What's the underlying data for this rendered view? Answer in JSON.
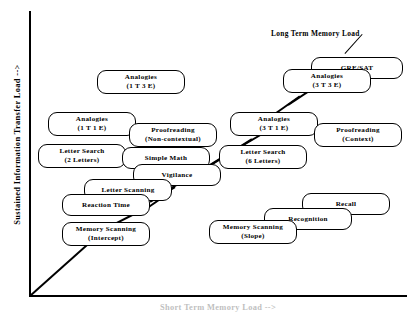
{
  "figure": {
    "y_axis_label": "Sustained Information Transfer Load -->",
    "x_axis_label": "Short Term Memory Load -->",
    "annotation": "Long Term Memory Load"
  },
  "chart_data": {
    "type": "scatter",
    "title": "",
    "xlabel": "Short Term Memory Load -->",
    "ylabel": "Sustained Information Transfer Load -->",
    "grid": false,
    "legend": null,
    "annotations": [
      "Long Term Memory Load"
    ],
    "nodes": [
      {
        "id": "analogies-1t3e",
        "line1": "Analogies",
        "line2": "(1 T   3 E)",
        "x": 97,
        "y": 70,
        "w": 88,
        "h": 24
      },
      {
        "id": "gre-sat",
        "line1": "GRE/SAT",
        "line2": "",
        "x": 311,
        "y": 57,
        "w": 92,
        "h": 22
      },
      {
        "id": "analogies-3t3e",
        "line1": "Analogies",
        "line2": "(3 T   3 E)",
        "x": 283,
        "y": 69,
        "w": 88,
        "h": 24
      },
      {
        "id": "analogies-1t1e",
        "line1": "Analogies",
        "line2": "(1 T   1 E)",
        "x": 48,
        "y": 112,
        "w": 88,
        "h": 24
      },
      {
        "id": "proofreading-noncontextual",
        "line1": "Proofreading",
        "line2": "(Non-contextual)",
        "x": 129,
        "y": 123,
        "w": 88,
        "h": 24
      },
      {
        "id": "analogies-3t1e",
        "line1": "Analogies",
        "line2": "(3 T   1 E)",
        "x": 230,
        "y": 112,
        "w": 88,
        "h": 24
      },
      {
        "id": "proofreading-context",
        "line1": "Proofreading",
        "line2": "(Context)",
        "x": 314,
        "y": 123,
        "w": 88,
        "h": 24
      },
      {
        "id": "letter-search-2",
        "line1": "Letter Search",
        "line2": "(2 Letters)",
        "x": 38,
        "y": 144,
        "w": 88,
        "h": 24
      },
      {
        "id": "simple-math",
        "line1": "Simple Math",
        "line2": "",
        "x": 122,
        "y": 147,
        "w": 88,
        "h": 22
      },
      {
        "id": "letter-search-6",
        "line1": "Letter Search",
        "line2": "(6 Letters)",
        "x": 219,
        "y": 145,
        "w": 88,
        "h": 24
      },
      {
        "id": "vigilance",
        "line1": "Vigilance",
        "line2": "",
        "x": 133,
        "y": 164,
        "w": 88,
        "h": 22
      },
      {
        "id": "letter-scanning",
        "line1": "Letter Scanning",
        "line2": "",
        "x": 84,
        "y": 179,
        "w": 88,
        "h": 22
      },
      {
        "id": "reaction-time",
        "line1": "Reaction Time",
        "line2": "",
        "x": 62,
        "y": 194,
        "w": 88,
        "h": 22
      },
      {
        "id": "memory-scanning-intercept",
        "line1": "Memory Scanning",
        "line2": "(Intercept)",
        "x": 62,
        "y": 222,
        "w": 88,
        "h": 24
      },
      {
        "id": "recall",
        "line1": "Recall",
        "line2": "",
        "x": 302,
        "y": 193,
        "w": 88,
        "h": 22
      },
      {
        "id": "recognition",
        "line1": "Recognition",
        "line2": "",
        "x": 264,
        "y": 208,
        "w": 88,
        "h": 22
      },
      {
        "id": "memory-scanning-slope",
        "line1": "Memory Scanning",
        "line2": "(Slope)",
        "x": 209,
        "y": 220,
        "w": 88,
        "h": 24
      }
    ]
  }
}
